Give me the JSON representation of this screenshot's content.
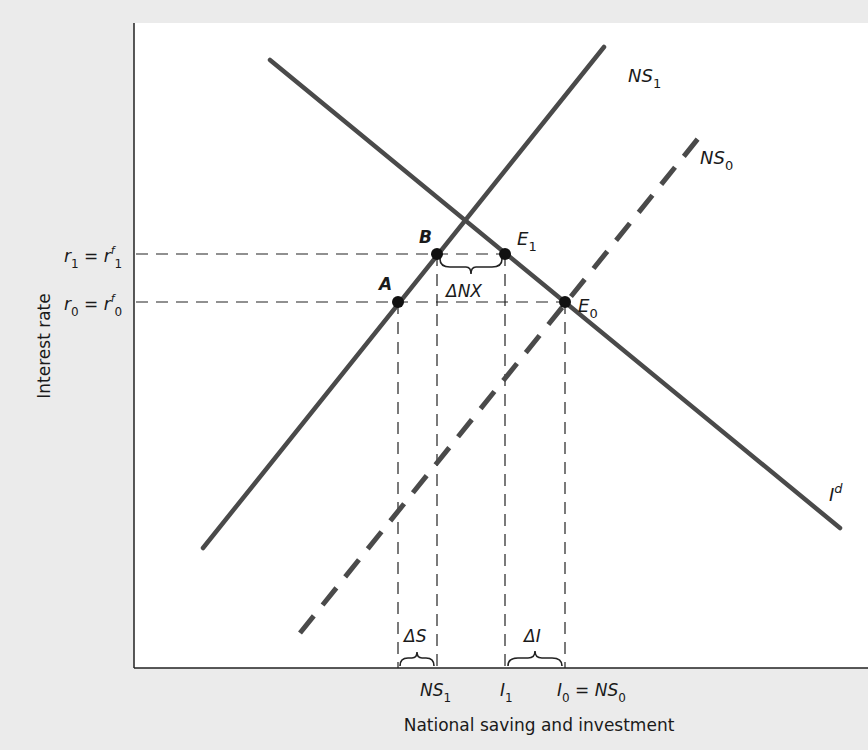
{
  "diagram": {
    "axis_labels": {
      "y": "Interest rate",
      "x": "National saving and investment"
    },
    "y_ticks": [
      {
        "main": "r",
        "sub": "1",
        "eq": " = r",
        "sup": "f",
        "sub2": "1"
      },
      {
        "main": "r",
        "sub": "0",
        "eq": " = r",
        "sup": "f",
        "sub2": "0"
      }
    ],
    "x_ticks": [
      {
        "main": "NS",
        "sub": "1"
      },
      {
        "main": "I",
        "sub": "1"
      },
      {
        "main": "I",
        "sub": "0",
        "eq": " = NS",
        "sub2": "0"
      }
    ],
    "curves": [
      {
        "name": "NS",
        "sub": "1",
        "style": "solid"
      },
      {
        "name": "NS",
        "sub": "0",
        "style": "dashed"
      },
      {
        "name": "I",
        "sup": "d",
        "style": "solid"
      }
    ],
    "points": [
      {
        "label": "A"
      },
      {
        "label": "B"
      },
      {
        "label": "E",
        "sub": "1"
      },
      {
        "label": "E",
        "sub": "0"
      }
    ],
    "brackets": [
      {
        "label": "ΔNX"
      },
      {
        "label": "ΔS"
      },
      {
        "label": "ΔI"
      }
    ],
    "colors": {
      "background": "#ebebeb",
      "plot": "#ffffff",
      "line": "#4a4a4a",
      "point": "#111111"
    }
  }
}
